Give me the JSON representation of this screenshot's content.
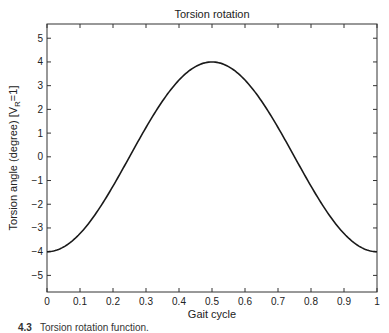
{
  "chart_data": {
    "type": "line",
    "title": "Torsion rotation",
    "xlabel": "Gait cycle",
    "ylabel": "Torsion angle (degree) [V",
    "ylabel_subscript": "R",
    "ylabel_suffix": "=1]",
    "xlim": [
      0,
      1
    ],
    "ylim": [
      -5.7,
      5.6
    ],
    "x_ticks": [
      0,
      0.1,
      0.2,
      0.3,
      0.4,
      0.5,
      0.6,
      0.7,
      0.8,
      0.9,
      1
    ],
    "x_tick_labels": [
      "0",
      "0.1",
      "0.2",
      "0.3",
      "0.4",
      "0.5",
      "0.6",
      "0.7",
      "0.8",
      "0.9",
      "1"
    ],
    "y_ticks": [
      5,
      4,
      3,
      2,
      1,
      0,
      -1,
      -2,
      -3,
      -4,
      -5
    ],
    "y_tick_labels": [
      "5",
      "4",
      "3",
      "2",
      "1",
      "0",
      "−1",
      "−2",
      "−3",
      "−4",
      "−5"
    ],
    "grid": false,
    "legend": null,
    "series": [
      {
        "name": "Torsion rotation",
        "color": "#1a1a1a",
        "function": "-4*cos(2*pi*x)",
        "x": [
          0,
          0.05,
          0.1,
          0.15,
          0.2,
          0.25,
          0.3,
          0.35,
          0.4,
          0.45,
          0.5,
          0.55,
          0.6,
          0.65,
          0.7,
          0.75,
          0.8,
          0.85,
          0.9,
          0.95,
          1
        ],
        "values": [
          -4.0,
          -3.8,
          -3.24,
          -2.35,
          -1.24,
          0.0,
          1.24,
          2.35,
          3.24,
          3.8,
          4.0,
          3.8,
          3.24,
          2.35,
          1.24,
          0.0,
          -1.24,
          -2.35,
          -3.24,
          -3.8,
          -4.0
        ]
      }
    ]
  },
  "caption": {
    "number": "4.3",
    "text": "Torsion rotation function."
  }
}
